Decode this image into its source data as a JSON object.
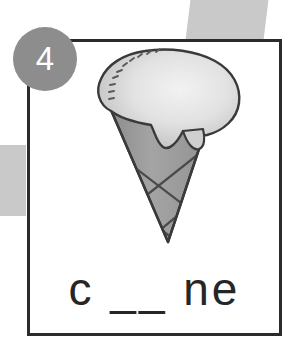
{
  "worksheet": {
    "item_number": "4",
    "prompt_word": "c __ ne",
    "answer_blank_count": 1,
    "illustration_name": "ice-cream-cone",
    "card_background": "#ffffff",
    "card_border_color": "#2b2b2b",
    "badge_color": "#8d8d8d",
    "badge_text_color": "#ffffff",
    "text_color": "#262626",
    "decoration_color": "#c9c9c9",
    "illustration": {
      "scoop_fill_light": "#e8e8e8",
      "scoop_fill_mid": "#cfcfcf",
      "cone_fill": "#9c9c9c",
      "cone_fill_dark": "#8a8a8a",
      "outline_color": "#3a3a3a",
      "waffle_line_color": "#4a4a4a"
    }
  }
}
